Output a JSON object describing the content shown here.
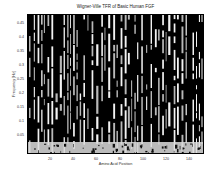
{
  "chart_data": {
    "type": "heatmap",
    "title": "Wigner-Ville TFR of Basic Human FGF",
    "xlabel": "Amino Acid Position",
    "ylabel": "Frequency [Hz]",
    "xticks": [
      20,
      40,
      60,
      80,
      100,
      120,
      140
    ],
    "yticks": [
      0.05,
      0.1,
      0.15,
      0.2,
      0.25,
      0.3,
      0.35,
      0.4,
      0.45
    ],
    "xlim": [
      0,
      152
    ],
    "ylim": [
      0,
      0.5
    ],
    "colormap": "grayscale (black = high, white = low)",
    "grid": false
  },
  "labels": {
    "title": "Wigner-Ville TFR of Basic Human FGF",
    "xlabel": "Amino Acid Position",
    "ylabel": "Frequency [Hz]",
    "x": [
      "20",
      "40",
      "60",
      "80",
      "100",
      "120",
      "140"
    ],
    "y": [
      "0.45",
      "0.4",
      "0.35",
      "0.3",
      "0.25",
      "0.2",
      "0.15",
      "0.1",
      "0.05"
    ]
  }
}
